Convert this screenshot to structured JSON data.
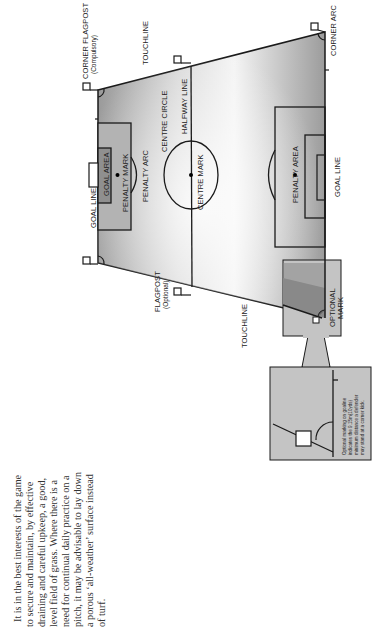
{
  "figure": {
    "labels": {
      "corner_flagpost": "CORNER FLAGPOST",
      "corner_flagpost_note": "(Compulsory)",
      "touchline_top": "TOUCHLINE",
      "touchline_bottom": "TOUCHLINE",
      "corner_arc": "CORNER ARC",
      "halfway_line": "HALFWAY LINE",
      "centre_circle": "CENTRE CIRCLE",
      "centre_mark": "CENTRE MARK",
      "goal_area": "GOAL AREA",
      "penalty_mark": "PENALTY MARK",
      "penalty_arc": "PENALTY ARC",
      "goal_line_left": "GOAL LINE",
      "goal_line_right": "GOAL LINE",
      "penalty_area": "PENALTY AREA",
      "flagpost": "FLAGPOST",
      "flagpost_note": "(Optional)",
      "optional_mark_1": "OPTIONAL",
      "optional_mark_2": "MARK"
    },
    "inset_note": [
      "Optional marking on goaline",
      "indicates the 9.15m(10yds)",
      "minimum distance a defender",
      "may stand at a corner kick."
    ]
  },
  "body_text": [
    "It is in the best interests of the game",
    "to secure and maintain, by effective",
    "draining and careful upkeep, a good,",
    "level field of grass. Where there is a",
    "need for continual daily practice on a",
    "pitch, it may be advisable to lay down",
    "a porous ‘all-weather’ surface instead",
    "of turf."
  ]
}
